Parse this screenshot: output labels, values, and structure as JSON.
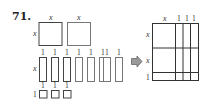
{
  "problem": {
    "number": "71."
  },
  "tiles": {
    "large_squares": {
      "count": 2,
      "side_label": "x"
    },
    "rectangles": {
      "count": 8,
      "width_label": "1",
      "height_label": "x"
    },
    "small_squares": {
      "count": 3,
      "side_label": "1"
    }
  },
  "arrow": {
    "icon": "right-arrow-icon",
    "color": "#999999"
  },
  "result_rectangle": {
    "top_labels": [
      "x",
      "1",
      "1",
      "1"
    ],
    "left_labels": [
      "x",
      "x",
      "1"
    ]
  }
}
